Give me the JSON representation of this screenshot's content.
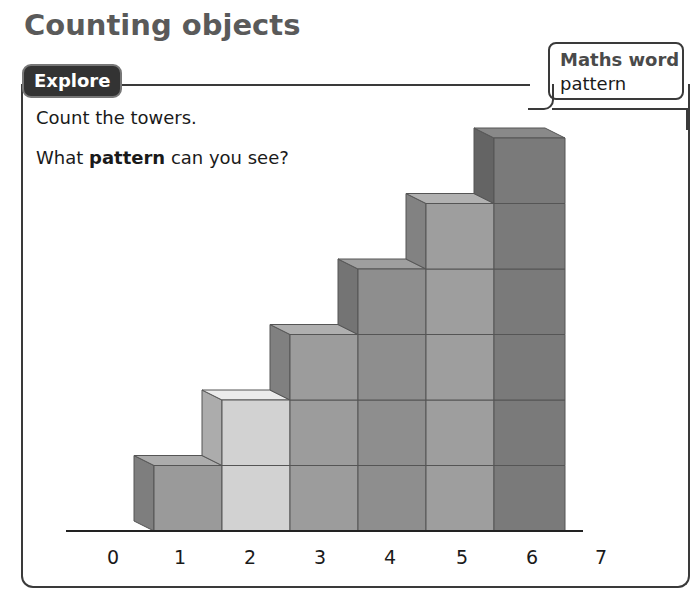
{
  "page": {
    "title": "Counting objects"
  },
  "explore": {
    "tag": "Explore",
    "prompt_line1": "Count the towers.",
    "prompt_line2_prefix": "What ",
    "prompt_line2_bold": "pattern",
    "prompt_line2_suffix": " can you see?"
  },
  "maths_word_box": {
    "title": "Maths word",
    "word": "pattern"
  },
  "chart_data": {
    "type": "bar",
    "categories": [
      "1",
      "2",
      "3",
      "4",
      "5",
      "6"
    ],
    "values": [
      1,
      2,
      3,
      4,
      5,
      6
    ],
    "xlabel": "",
    "ylabel": "",
    "axis_ticks": [
      "0",
      "1",
      "2",
      "3",
      "4",
      "5",
      "6",
      "7"
    ],
    "tower_colors": [
      "#9a9a9a",
      "#d2d2d2",
      "#9c9c9c",
      "#8e8e8e",
      "#9e9e9e",
      "#7a7a7a"
    ]
  },
  "number_line": {
    "labels": [
      "0",
      "1",
      "2",
      "3",
      "4",
      "5",
      "6",
      "7"
    ]
  }
}
